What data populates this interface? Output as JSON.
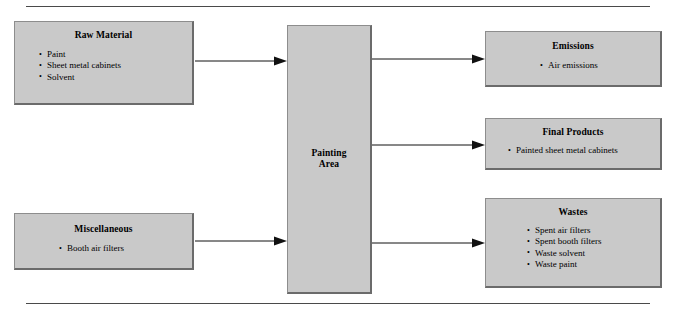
{
  "diagram": {
    "rules": {
      "top": "horizontal-rule",
      "bottom": "horizontal-rule"
    },
    "colors": {
      "node_fill": "#c9c9c9",
      "node_border_light": "#8d8d8d",
      "node_border_dark": "#6b6b6b",
      "arrow": "#111111",
      "rule": "#4a4a4a",
      "background": "#ffffff"
    },
    "inputs": [
      {
        "id": "raw-material",
        "title": "Raw Material",
        "items": [
          "Paint",
          "Sheet metal cabinets",
          "Solvent"
        ]
      },
      {
        "id": "miscellaneous",
        "title": "Miscellaneous",
        "items": [
          "Booth air filters"
        ]
      }
    ],
    "process": {
      "id": "painting-area",
      "title_line1": "Painting",
      "title_line2": "Area"
    },
    "outputs": [
      {
        "id": "emissions",
        "title": "Emissions",
        "items": [
          "Air emissions"
        ]
      },
      {
        "id": "final-products",
        "title": "Final Products",
        "items": [
          "Painted sheet metal cabinets"
        ]
      },
      {
        "id": "wastes",
        "title": "Wastes",
        "items": [
          "Spent air filters",
          "Spent booth filters",
          "Waste solvent",
          "Waste paint"
        ]
      }
    ],
    "arrows": [
      {
        "id": "raw-material-to-painting-area",
        "from": "raw-material",
        "to": "painting-area"
      },
      {
        "id": "miscellaneous-to-painting-area",
        "from": "miscellaneous",
        "to": "painting-area"
      },
      {
        "id": "painting-area-to-emissions",
        "from": "painting-area",
        "to": "emissions"
      },
      {
        "id": "painting-area-to-final-products",
        "from": "painting-area",
        "to": "final-products"
      },
      {
        "id": "painting-area-to-wastes",
        "from": "painting-area",
        "to": "wastes"
      }
    ]
  }
}
